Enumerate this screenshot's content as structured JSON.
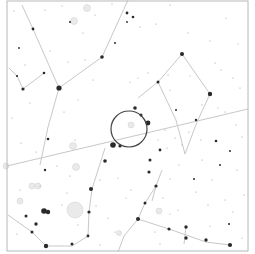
{
  "chart": {
    "background": "#ffffff",
    "frame": {
      "x": 7,
      "y": 1,
      "w": 241,
      "h": 250,
      "color": "#b8b8b8"
    },
    "line_color": "#c8c8c8",
    "star_color": "#2a2a2a",
    "target_circle": {
      "cx": 129,
      "cy": 129,
      "r": 18,
      "color": "#444444"
    },
    "ecliptic": [
      [
        7,
        166
      ],
      [
        248,
        109
      ]
    ],
    "constellation_lines": [
      [
        [
          22,
          5
        ],
        [
          33,
          29
        ],
        [
          59,
          88
        ]
      ],
      [
        [
          59,
          88
        ],
        [
          102,
          57
        ],
        [
          128,
          0
        ]
      ],
      [
        [
          59,
          88
        ],
        [
          48,
          127
        ],
        [
          40,
          165
        ]
      ],
      [
        [
          9,
          68
        ],
        [
          17,
          76
        ],
        [
          23,
          89
        ],
        [
          44,
          73
        ]
      ],
      [
        [
          182,
          54
        ],
        [
          210,
          94
        ]
      ],
      [
        [
          182,
          54
        ],
        [
          158,
          82
        ],
        [
          138,
          98
        ]
      ],
      [
        [
          210,
          94
        ],
        [
          197,
          122
        ],
        [
          185,
          154
        ]
      ],
      [
        [
          158,
          82
        ],
        [
          176,
          120
        ],
        [
          185,
          154
        ]
      ],
      [
        [
          105,
          148
        ],
        [
          92,
          189
        ],
        [
          89,
          212
        ],
        [
          88,
          236
        ]
      ],
      [
        [
          88,
          236
        ],
        [
          72,
          246
        ],
        [
          46,
          246
        ],
        [
          32,
          232
        ],
        [
          8,
          215
        ]
      ],
      [
        [
          156,
          186
        ],
        [
          145,
          203
        ],
        [
          138,
          219
        ]
      ],
      [
        [
          138,
          219
        ],
        [
          169,
          229
        ],
        [
          206,
          242
        ],
        [
          230,
          245
        ]
      ],
      [
        [
          186,
          227
        ],
        [
          184,
          244
        ]
      ],
      [
        [
          138,
          219
        ],
        [
          124,
          236
        ],
        [
          118,
          252
        ]
      ],
      [
        [
          152,
          201
        ],
        [
          156,
          186
        ],
        [
          162,
          170
        ]
      ]
    ],
    "stars": [
      {
        "x": 59,
        "y": 88,
        "r": 2.6
      },
      {
        "x": 102,
        "y": 57,
        "r": 1.8
      },
      {
        "x": 33,
        "y": 29,
        "r": 1.4
      },
      {
        "x": 23,
        "y": 89,
        "r": 1.6
      },
      {
        "x": 44,
        "y": 73,
        "r": 1.3
      },
      {
        "x": 17,
        "y": 76,
        "r": 1.1
      },
      {
        "x": 19,
        "y": 48,
        "r": 0.9
      },
      {
        "x": 127,
        "y": 13,
        "r": 1.4
      },
      {
        "x": 133,
        "y": 17,
        "r": 1.3
      },
      {
        "x": 115,
        "y": 43,
        "r": 1.0
      },
      {
        "x": 127,
        "y": 22,
        "r": 0.9
      },
      {
        "x": 70,
        "y": 22,
        "r": 1.0
      },
      {
        "x": 182,
        "y": 54,
        "r": 2.0
      },
      {
        "x": 210,
        "y": 94,
        "r": 2.2
      },
      {
        "x": 158,
        "y": 82,
        "r": 1.5
      },
      {
        "x": 135,
        "y": 108,
        "r": 1.8
      },
      {
        "x": 148,
        "y": 123,
        "r": 2.4
      },
      {
        "x": 141,
        "y": 115,
        "r": 1.5
      },
      {
        "x": 113,
        "y": 145,
        "r": 2.8
      },
      {
        "x": 120,
        "y": 146,
        "r": 1.6
      },
      {
        "x": 105,
        "y": 161,
        "r": 1.8
      },
      {
        "x": 91,
        "y": 189,
        "r": 2.0
      },
      {
        "x": 89,
        "y": 212,
        "r": 1.6
      },
      {
        "x": 88,
        "y": 236,
        "r": 1.4
      },
      {
        "x": 46,
        "y": 246,
        "r": 2.2
      },
      {
        "x": 72,
        "y": 244,
        "r": 1.5
      },
      {
        "x": 32,
        "y": 232,
        "r": 1.5
      },
      {
        "x": 36,
        "y": 224,
        "r": 1.7
      },
      {
        "x": 44,
        "y": 211,
        "r": 2.8
      },
      {
        "x": 48,
        "y": 212,
        "r": 2.2
      },
      {
        "x": 26,
        "y": 216,
        "r": 1.5
      },
      {
        "x": 48,
        "y": 139,
        "r": 1.3
      },
      {
        "x": 45,
        "y": 170,
        "r": 1.2
      },
      {
        "x": 150,
        "y": 160,
        "r": 1.5
      },
      {
        "x": 149,
        "y": 172,
        "r": 1.6
      },
      {
        "x": 156,
        "y": 186,
        "r": 1.6
      },
      {
        "x": 145,
        "y": 203,
        "r": 1.5
      },
      {
        "x": 138,
        "y": 219,
        "r": 2.0
      },
      {
        "x": 186,
        "y": 227,
        "r": 1.7
      },
      {
        "x": 186,
        "y": 238,
        "r": 1.7
      },
      {
        "x": 206,
        "y": 240,
        "r": 1.7
      },
      {
        "x": 230,
        "y": 245,
        "r": 2.1
      },
      {
        "x": 169,
        "y": 229,
        "r": 1.6
      },
      {
        "x": 216,
        "y": 141,
        "r": 1.3
      },
      {
        "x": 230,
        "y": 151,
        "r": 1.0
      },
      {
        "x": 196,
        "y": 120,
        "r": 1.2
      },
      {
        "x": 176,
        "y": 110,
        "r": 1.0
      },
      {
        "x": 229,
        "y": 224,
        "r": 1.0
      },
      {
        "x": 220,
        "y": 165,
        "r": 1.0
      },
      {
        "x": 160,
        "y": 150,
        "r": 1.4
      },
      {
        "x": 194,
        "y": 179,
        "r": 1.0
      }
    ],
    "faint_stars": [
      [
        14,
        11
      ],
      [
        45,
        10
      ],
      [
        62,
        6
      ],
      [
        83,
        33
      ],
      [
        95,
        15
      ],
      [
        112,
        4
      ],
      [
        140,
        27
      ],
      [
        156,
        24
      ],
      [
        170,
        5
      ],
      [
        188,
        33
      ],
      [
        210,
        41
      ],
      [
        226,
        18
      ],
      [
        238,
        44
      ],
      [
        25,
        65
      ],
      [
        50,
        51
      ],
      [
        68,
        62
      ],
      [
        85,
        60
      ],
      [
        93,
        80
      ],
      [
        78,
        100
      ],
      [
        64,
        112
      ],
      [
        30,
        103
      ],
      [
        12,
        118
      ],
      [
        21,
        143
      ],
      [
        36,
        152
      ],
      [
        40,
        186
      ],
      [
        57,
        166
      ],
      [
        70,
        176
      ],
      [
        75,
        140
      ],
      [
        130,
        82
      ],
      [
        138,
        78
      ],
      [
        148,
        73
      ],
      [
        168,
        75
      ],
      [
        170,
        90
      ],
      [
        190,
        76
      ],
      [
        215,
        63
      ],
      [
        221,
        70
      ],
      [
        233,
        78
      ],
      [
        240,
        88
      ],
      [
        236,
        125
      ],
      [
        242,
        137
      ],
      [
        218,
        108
      ],
      [
        202,
        105
      ],
      [
        225,
        112
      ],
      [
        100,
        180
      ],
      [
        118,
        178
      ],
      [
        126,
        198
      ],
      [
        131,
        190
      ],
      [
        96,
        206
      ],
      [
        67,
        193
      ],
      [
        62,
        205
      ],
      [
        78,
        225
      ],
      [
        108,
        218
      ],
      [
        115,
        232
      ],
      [
        100,
        245
      ],
      [
        20,
        190
      ],
      [
        17,
        234
      ],
      [
        163,
        198
      ],
      [
        170,
        179
      ],
      [
        179,
        165
      ],
      [
        202,
        160
      ],
      [
        212,
        180
      ],
      [
        237,
        170
      ],
      [
        244,
        195
      ],
      [
        225,
        200
      ],
      [
        208,
        205
      ],
      [
        196,
        192
      ],
      [
        170,
        214
      ],
      [
        178,
        210
      ],
      [
        155,
        232
      ],
      [
        160,
        244
      ],
      [
        210,
        226
      ],
      [
        242,
        238
      ],
      [
        233,
        212
      ],
      [
        165,
        130
      ],
      [
        175,
        138
      ],
      [
        182,
        145
      ],
      [
        158,
        140
      ],
      [
        167,
        148
      ],
      [
        189,
        132
      ],
      [
        201,
        140
      ]
    ],
    "deep_sky_objects": [
      {
        "x": 87,
        "y": 8,
        "r": 3.5
      },
      {
        "x": 74,
        "y": 21,
        "r": 3.5
      },
      {
        "x": 73,
        "y": 146,
        "r": 3.5
      },
      {
        "x": 76,
        "y": 167,
        "r": 3.5
      },
      {
        "x": 32,
        "y": 186,
        "r": 3.0
      },
      {
        "x": 38,
        "y": 186,
        "r": 3.0
      },
      {
        "x": 75,
        "y": 210,
        "r": 8.0
      },
      {
        "x": 20,
        "y": 201,
        "r": 3.0
      },
      {
        "x": 159,
        "y": 211,
        "r": 3.0
      },
      {
        "x": 131,
        "y": 125,
        "r": 3.0
      },
      {
        "x": 119,
        "y": 233,
        "r": 2.5
      },
      {
        "x": 6,
        "y": 166,
        "r": 3.0
      }
    ]
  }
}
